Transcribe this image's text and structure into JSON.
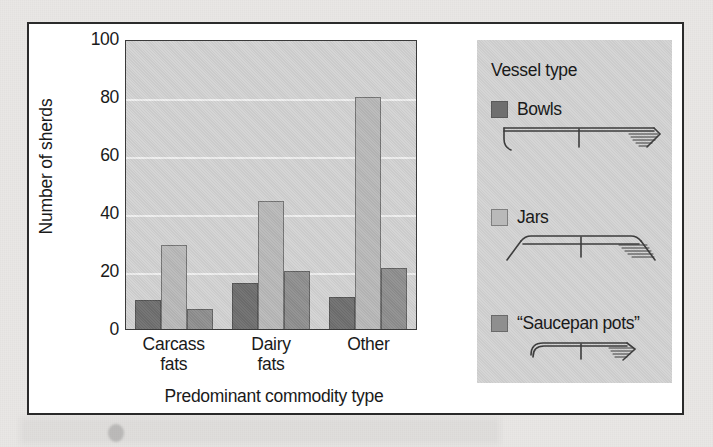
{
  "chart_data": {
    "type": "bar",
    "title": "",
    "xlabel": "Predominant commodity type",
    "ylabel": "Number of sherds",
    "categories": [
      "Carcass fats",
      "Dairy fats",
      "Other"
    ],
    "category_lines": [
      [
        "Carcass",
        "fats"
      ],
      [
        "Dairy",
        "fats"
      ],
      [
        "Other",
        ""
      ]
    ],
    "series": [
      {
        "name": "Bowls",
        "color": "#6f6f6f",
        "values": [
          10,
          16,
          11
        ]
      },
      {
        "name": "Jars",
        "color": "#b9b9b9",
        "values": [
          29,
          44,
          80
        ]
      },
      {
        "name": "“Saucepan pots”",
        "color": "#8f8f8f",
        "values": [
          7,
          20,
          21
        ]
      }
    ],
    "ylim": [
      0,
      100
    ],
    "yticks": [
      0,
      20,
      40,
      60,
      80,
      100
    ],
    "ytick_labels": [
      "0",
      "20",
      "40",
      "60",
      "80",
      "100"
    ],
    "grid": true,
    "grid_color": "#efefef",
    "legend_position": "right",
    "plot_background": "#d3d3d3"
  },
  "legend": {
    "title": "Vessel type",
    "panel_color": "#d3d3d3",
    "entries": [
      {
        "label": "Bowls",
        "color": "#6f6f6f",
        "profile": "bowl-profile"
      },
      {
        "label": "Jars",
        "color": "#b9b9b9",
        "profile": "jar-profile"
      },
      {
        "label": "“Saucepan pots”",
        "color": "#8f8f8f",
        "profile": "saucepan-pot-profile"
      }
    ]
  },
  "figure": {
    "border_color": "#2b2b2b",
    "background": "#ffffff",
    "page_background": "#e9e7e5"
  }
}
